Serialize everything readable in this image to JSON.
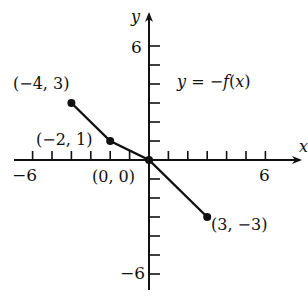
{
  "chart_data": {
    "type": "line",
    "title": "y = −f(x)",
    "xlabel": "x",
    "ylabel": "y",
    "xlim": [
      -7,
      7
    ],
    "ylim": [
      -7,
      7
    ],
    "grid": false,
    "x_tick_labels": [
      {
        "value": -6,
        "label": "−6"
      },
      {
        "value": 6,
        "label": "6"
      }
    ],
    "y_tick_labels": [
      {
        "value": 6,
        "label": "6"
      },
      {
        "value": -6,
        "label": "−6"
      }
    ],
    "tick_step": 1,
    "series": [
      {
        "name": "y = −f(x)",
        "points": [
          {
            "x": -4,
            "y": 3,
            "label": "(−4, 3)"
          },
          {
            "x": -2,
            "y": 1,
            "label": "(−2, 1)"
          },
          {
            "x": 0,
            "y": 0,
            "label": "(0, 0)"
          },
          {
            "x": 3,
            "y": -3,
            "label": "(3, −3)"
          }
        ]
      }
    ]
  },
  "labels": {
    "equation_y": "y",
    "equation_eq": " = −",
    "equation_f": "f",
    "equation_paren": "(",
    "equation_x": "x",
    "equation_close": ")",
    "axis_x": "x",
    "axis_y": "y",
    "tick_neg6_x": "−6",
    "tick_pos6_x": "6",
    "tick_pos6_y": "6",
    "tick_neg6_y": "−6",
    "pt_a": "(−4, 3)",
    "pt_b": "(−2, 1)",
    "pt_c": "(0, 0)",
    "pt_d": "(3, −3)"
  },
  "colors": {
    "ink": "#111111",
    "background": "#ffffff"
  }
}
